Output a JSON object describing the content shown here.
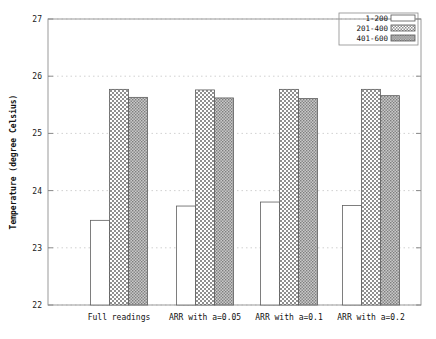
{
  "chart_data": {
    "type": "bar",
    "title": "",
    "subtitle": "",
    "xlabel": "",
    "ylabel": "Temperature (degree Celsius)",
    "ylim": [
      22,
      27
    ],
    "yticks": [
      22,
      23,
      24,
      25,
      26,
      27
    ],
    "ytick_labels": [
      "22",
      "23",
      "24",
      "25",
      "26",
      "27"
    ],
    "grid": true,
    "grid_axis": "y",
    "legend_position": "top-right",
    "categories": [
      "Full readings",
      "ARR with a=0.05",
      "ARR with a=0.1",
      "ARR with a=0.2"
    ],
    "series": [
      {
        "name": "1-200",
        "fill": "solid-white",
        "color": "#ffffff",
        "values": [
          23.48,
          23.73,
          23.8,
          23.74
        ]
      },
      {
        "name": "201-400",
        "fill": "checkerboard",
        "color": "#b4b4b4",
        "values": [
          25.77,
          25.76,
          25.77,
          25.77
        ]
      },
      {
        "name": "401-600",
        "fill": "dense-dots",
        "color": "#9a9a9a",
        "values": [
          25.63,
          25.62,
          25.61,
          25.66
        ]
      }
    ]
  },
  "axes": {
    "y_title": "Temperature (degree Celsius)",
    "y_ticks": [
      "22",
      "23",
      "24",
      "25",
      "26",
      "27"
    ],
    "x_ticks": [
      "Full readings",
      "ARR with a=0.05",
      "ARR with a=0.1",
      "ARR with a=0.2"
    ]
  },
  "legend": {
    "items": [
      {
        "label": "1-200"
      },
      {
        "label": "201-400"
      },
      {
        "label": "401-600"
      }
    ]
  }
}
